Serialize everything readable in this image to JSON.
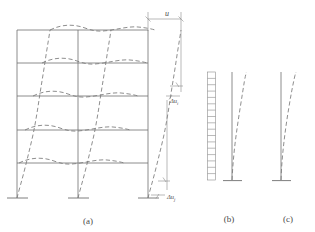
{
  "figure": {
    "captions": [
      {
        "key": "a",
        "label": "(a)",
        "x": 88,
        "y": 224,
        "description": "multistory moment frame, shear-type deformed shape"
      },
      {
        "key": "b",
        "label": "(b)",
        "x": 229,
        "y": 222,
        "description": "shear wall with frame, combined deformation"
      },
      {
        "key": "c",
        "label": "(c)",
        "x": 288,
        "y": 222,
        "description": "cantilever shear wall, flexural deformation"
      }
    ],
    "dimension_labels": [
      {
        "name": "total-drift",
        "text": "u",
        "x": 167,
        "y": 13,
        "panel": "a"
      }
    ],
    "drift_labels": [
      {
        "name": "story-drift-i",
        "symbol": "Δu",
        "subscript": "i",
        "x": 174,
        "y": 101,
        "panel": "a"
      },
      {
        "name": "story-drift-j",
        "symbol": "Δu",
        "subscript": "j",
        "x": 172,
        "y": 196,
        "panel": "a"
      }
    ],
    "colors": {
      "solid_stroke": "#6f6f6f",
      "dashed_stroke": "#7a7a7a",
      "dimension_stroke": "#8a8a8a",
      "text": "#4a4a4a",
      "background": "#ffffff"
    },
    "frame": {
      "stories": 5,
      "bays": 2,
      "column_x": [
        17,
        78,
        148
      ],
      "floor_y": [
        30,
        63,
        96,
        130,
        163
      ],
      "base_y": 198,
      "deformed_style": "dashed"
    },
    "panel_b": {
      "wall_x": 212,
      "wall_top_y": 72,
      "wall_bottom_y": 180,
      "ladder_rungs": 17,
      "column_x": 232,
      "column_top_y": 72,
      "column_base_y": 182
    },
    "panel_c": {
      "column_x": 281,
      "column_top_y": 72,
      "column_base_y": 182
    }
  }
}
